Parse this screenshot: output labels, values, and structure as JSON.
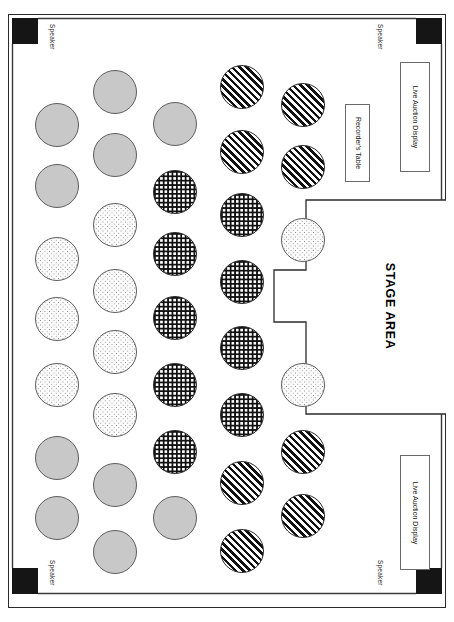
{
  "document": {
    "kind": "event-floor-plan",
    "title": "STAGE AREA"
  },
  "stage": {
    "label": "STAGE AREA"
  },
  "speakers": [
    {
      "label": "Speaker",
      "position": "top-left",
      "box": {
        "x": 12,
        "y": 18,
        "w": 26,
        "h": 26
      },
      "label_at": {
        "x": 56,
        "y": 24
      }
    },
    {
      "label": "Speaker",
      "position": "top-right",
      "box": {
        "x": 416,
        "y": 18,
        "w": 26,
        "h": 26
      },
      "label_at": {
        "x": 384,
        "y": 24
      }
    },
    {
      "label": "Speaker",
      "position": "bottom-left",
      "box": {
        "x": 12,
        "y": 568,
        "w": 26,
        "h": 26
      },
      "label_at": {
        "x": 56,
        "y": 560
      }
    },
    {
      "label": "Speaker",
      "position": "bottom-right",
      "box": {
        "x": 416,
        "y": 568,
        "w": 26,
        "h": 26
      },
      "label_at": {
        "x": 384,
        "y": 560
      }
    }
  ],
  "fixtures": [
    {
      "label": "Recorder's Table",
      "name": "recorders-table",
      "x": 345,
      "y": 104,
      "w": 25,
      "h": 78
    },
    {
      "label": "Live Auction Display",
      "name": "live-auction-display-top",
      "x": 400,
      "y": 62,
      "w": 30,
      "h": 110
    },
    {
      "label": "Live Auction Display",
      "name": "live-auction-display-bottom",
      "x": 400,
      "y": 455,
      "w": 30,
      "h": 115
    }
  ],
  "legend": {
    "patterns": [
      {
        "key": "gray",
        "name": "dense-gray-stipple",
        "color": "#c8c8c8"
      },
      {
        "key": "light",
        "name": "light-sparse-dots",
        "color": "#fbfbfb"
      },
      {
        "key": "grid",
        "name": "dark-crosshatch",
        "color": "#111111"
      },
      {
        "key": "diag",
        "name": "diagonal-stripe",
        "color": "#111111"
      }
    ]
  },
  "tables": [
    {
      "id": "c1-r1",
      "col": 1,
      "pattern": "gray",
      "cx": 57,
      "cy": 125,
      "r": 22
    },
    {
      "id": "c1-r2",
      "col": 1,
      "pattern": "gray",
      "cx": 57,
      "cy": 186,
      "r": 22
    },
    {
      "id": "c1-r3",
      "col": 1,
      "pattern": "light",
      "cx": 57,
      "cy": 259,
      "r": 22
    },
    {
      "id": "c1-r4",
      "col": 1,
      "pattern": "light",
      "cx": 57,
      "cy": 319,
      "r": 22
    },
    {
      "id": "c1-r5",
      "col": 1,
      "pattern": "light",
      "cx": 57,
      "cy": 385,
      "r": 22
    },
    {
      "id": "c1-r6",
      "col": 1,
      "pattern": "gray",
      "cx": 57,
      "cy": 458,
      "r": 22
    },
    {
      "id": "c1-r7",
      "col": 1,
      "pattern": "gray",
      "cx": 57,
      "cy": 518,
      "r": 22
    },
    {
      "id": "c2-r1",
      "col": 2,
      "pattern": "gray",
      "cx": 115,
      "cy": 92,
      "r": 22
    },
    {
      "id": "c2-r2",
      "col": 2,
      "pattern": "gray",
      "cx": 115,
      "cy": 155,
      "r": 22
    },
    {
      "id": "c2-r3",
      "col": 2,
      "pattern": "light",
      "cx": 115,
      "cy": 225,
      "r": 22
    },
    {
      "id": "c2-r4",
      "col": 2,
      "pattern": "light",
      "cx": 115,
      "cy": 291,
      "r": 22
    },
    {
      "id": "c2-r5",
      "col": 2,
      "pattern": "light",
      "cx": 115,
      "cy": 352,
      "r": 22
    },
    {
      "id": "c2-r6",
      "col": 2,
      "pattern": "light",
      "cx": 115,
      "cy": 415,
      "r": 22
    },
    {
      "id": "c2-r7",
      "col": 2,
      "pattern": "gray",
      "cx": 115,
      "cy": 485,
      "r": 22
    },
    {
      "id": "c2-r8",
      "col": 2,
      "pattern": "gray",
      "cx": 115,
      "cy": 552,
      "r": 22
    },
    {
      "id": "c3-r1",
      "col": 3,
      "pattern": "gray",
      "cx": 175,
      "cy": 124,
      "r": 22
    },
    {
      "id": "c3-r2",
      "col": 3,
      "pattern": "grid",
      "cx": 175,
      "cy": 192,
      "r": 22
    },
    {
      "id": "c3-r3",
      "col": 3,
      "pattern": "grid",
      "cx": 175,
      "cy": 254,
      "r": 22
    },
    {
      "id": "c3-r4",
      "col": 3,
      "pattern": "grid",
      "cx": 175,
      "cy": 318,
      "r": 22
    },
    {
      "id": "c3-r5",
      "col": 3,
      "pattern": "grid",
      "cx": 175,
      "cy": 385,
      "r": 22
    },
    {
      "id": "c3-r6",
      "col": 3,
      "pattern": "grid",
      "cx": 175,
      "cy": 452,
      "r": 22
    },
    {
      "id": "c3-r7",
      "col": 3,
      "pattern": "gray",
      "cx": 175,
      "cy": 518,
      "r": 22
    },
    {
      "id": "c4-r1",
      "col": 4,
      "pattern": "diag",
      "cx": 242,
      "cy": 87,
      "r": 22
    },
    {
      "id": "c4-r2",
      "col": 4,
      "pattern": "diag",
      "cx": 242,
      "cy": 152,
      "r": 22
    },
    {
      "id": "c4-r3",
      "col": 4,
      "pattern": "grid",
      "cx": 242,
      "cy": 215,
      "r": 22
    },
    {
      "id": "c4-r4",
      "col": 4,
      "pattern": "grid",
      "cx": 242,
      "cy": 282,
      "r": 22
    },
    {
      "id": "c4-r5",
      "col": 4,
      "pattern": "grid",
      "cx": 242,
      "cy": 348,
      "r": 22
    },
    {
      "id": "c4-r6",
      "col": 4,
      "pattern": "grid",
      "cx": 242,
      "cy": 415,
      "r": 22
    },
    {
      "id": "c4-r7",
      "col": 4,
      "pattern": "diag",
      "cx": 242,
      "cy": 483,
      "r": 22
    },
    {
      "id": "c4-r8",
      "col": 4,
      "pattern": "diag",
      "cx": 242,
      "cy": 551,
      "r": 22
    },
    {
      "id": "c5-r1",
      "col": 5,
      "pattern": "diag",
      "cx": 303,
      "cy": 105,
      "r": 22
    },
    {
      "id": "c5-r2",
      "col": 5,
      "pattern": "diag",
      "cx": 303,
      "cy": 167,
      "r": 22
    },
    {
      "id": "c5-r3",
      "col": 5,
      "pattern": "light",
      "cx": 303,
      "cy": 240,
      "r": 22
    },
    {
      "id": "c5-r4",
      "col": 5,
      "pattern": "light",
      "cx": 303,
      "cy": 385,
      "r": 22
    },
    {
      "id": "c5-r5",
      "col": 5,
      "pattern": "diag",
      "cx": 303,
      "cy": 452,
      "r": 22
    },
    {
      "id": "c5-r6",
      "col": 5,
      "pattern": "diag",
      "cx": 303,
      "cy": 516,
      "r": 22
    }
  ]
}
